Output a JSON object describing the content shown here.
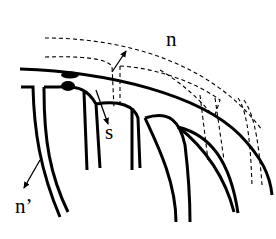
{
  "diagram": {
    "colors": {
      "stroke": "#000000",
      "background": "#ffffff"
    },
    "labels": {
      "n": "n",
      "s": "s",
      "n_prime": "n’"
    },
    "arrows": [
      {
        "name": "n",
        "from": [
          112,
          72
        ],
        "to": [
          126,
          51
        ]
      },
      {
        "name": "s",
        "from": [
          96,
          90
        ],
        "to": [
          108,
          124
        ]
      },
      {
        "name": "n_prime",
        "from": [
          40,
          160
        ],
        "to": [
          24,
          188
        ]
      }
    ]
  }
}
